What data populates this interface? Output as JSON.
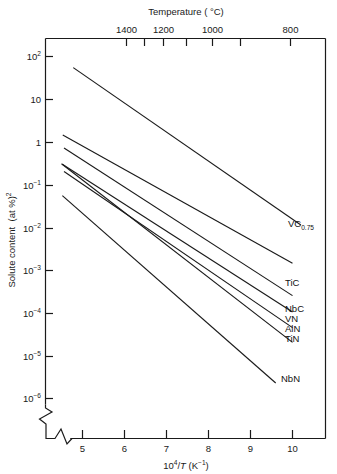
{
  "figure": {
    "title_top_axis": "Temperature ( °C)",
    "ylabel_main": "Solute content",
    "ylabel_unit": "(at %)",
    "ylabel_unit_exp": "2",
    "xlabel_num": "10",
    "xlabel_num_exp": "4",
    "xlabel_div": "/",
    "xlabel_var": "T",
    "xlabel_unit": "(K",
    "xlabel_unit_exp": "−1",
    "xlabel_unit_close": ")",
    "axis_break_symbol": "zigzag-break"
  },
  "chart_data": {
    "type": "line",
    "title": "",
    "xlabel": "10^4 / T (K^-1)",
    "ylabel": "Solute content (at %)^2",
    "xlim": [
      4.4,
      10.8
    ],
    "ylim": [
      1e-06,
      300
    ],
    "yscale": "log",
    "grid": false,
    "legend": "inline-right-labels",
    "x_ticks": [
      5,
      6,
      7,
      8,
      9,
      10
    ],
    "x_tick_labels": [
      "5",
      "6",
      "7",
      "8",
      "9",
      "10"
    ],
    "y_ticks": [
      100,
      10,
      1,
      0.1,
      0.01,
      0.001,
      0.0001,
      1e-05,
      1e-06
    ],
    "y_tick_labels": [
      "10²",
      "10",
      "1",
      "10⁻¹",
      "10⁻²",
      "10⁻³",
      "10⁻⁴",
      "10⁻⁵",
      "10⁻⁶"
    ],
    "secondary_axis": {
      "label": "Temperature ( °C)",
      "position": "top",
      "ticks": [
        1400,
        1300,
        1200,
        1100,
        1000,
        900,
        800
      ],
      "tick_labels": [
        "1400",
        "",
        "1200",
        "",
        "1000",
        "",
        "800"
      ],
      "visible_labels": [
        "1400",
        "1200",
        "1000",
        "800"
      ]
    },
    "series": [
      {
        "name": "VC0.75",
        "label": "VC",
        "label_sub": "0.75",
        "x": [
          4.78,
          10.2
        ],
        "y": [
          55.0,
          0.0115
        ]
      },
      {
        "name": "TiC",
        "label": "TiC",
        "label_sub": "",
        "x": [
          4.53,
          10.0
        ],
        "y": [
          1.45,
          0.00145
        ]
      },
      {
        "name": "NbC",
        "label": "NbC",
        "label_sub": "",
        "x": [
          4.56,
          10.0
        ],
        "y": [
          0.72,
          0.000255
        ]
      },
      {
        "name": "VN",
        "label": "VN",
        "label_sub": "",
        "x": [
          4.52,
          10.0
        ],
        "y": [
          0.3,
          0.000105
        ]
      },
      {
        "name": "AlN",
        "label": "AlN",
        "label_sub": "",
        "x": [
          4.56,
          10.0
        ],
        "y": [
          0.205,
          4.55e-05
        ]
      },
      {
        "name": "TiN",
        "label": "TiN",
        "label_sub": "",
        "x": [
          4.5,
          10.0
        ],
        "y": [
          0.31,
          2.05e-05
        ]
      },
      {
        "name": "NbN",
        "label": "NbN",
        "label_sub": "",
        "x": [
          4.52,
          9.6
        ],
        "y": [
          0.0555,
          2.3e-06
        ]
      }
    ]
  }
}
